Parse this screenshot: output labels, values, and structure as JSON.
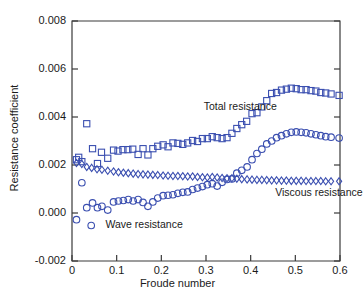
{
  "figure": {
    "background_color": "#ffffff",
    "axis_color": "#3a3a3a",
    "marker_color": "#3b4fb0",
    "text_color": "#1a1a1a"
  },
  "axes": {
    "ylabel": "Resistance coefficient",
    "xlabel": "Froude number",
    "yticks": [
      "0.008",
      "0.006",
      "0.004",
      "0.002",
      "0.000",
      "-0.002"
    ],
    "ytick_values": [
      0.008,
      0.006,
      0.004,
      0.002,
      0.0,
      -0.002
    ],
    "xticks": [
      "0",
      "0.1",
      "0.2",
      "0.3",
      "0.4",
      "0.5",
      "0.6"
    ],
    "xtick_values": [
      0,
      0.1,
      0.2,
      0.3,
      0.4,
      0.5,
      0.6
    ]
  },
  "annotations": [
    {
      "name": "total-resistance-label",
      "text": "Total resistance",
      "x": 0.295,
      "y": 0.00442
    },
    {
      "name": "viscous-resistance-label",
      "text": "Viscous resistance",
      "x": 0.455,
      "y": 0.00082
    },
    {
      "name": "wave-resistance-label",
      "text": "Wave resistance",
      "x": 0.075,
      "y": -0.00052
    }
  ],
  "legend_markers": [
    {
      "name": "wave-resistance-legend-marker",
      "marker": "circle",
      "x": 0.043,
      "y": -0.00052
    }
  ],
  "chart_data": {
    "type": "scatter",
    "title": "",
    "xlabel": "Froude number",
    "ylabel": "Resistance coefficient",
    "xlim": [
      0.0,
      0.6
    ],
    "ylim": [
      -0.002,
      0.008
    ],
    "grid": false,
    "legend_position": "inline-annotations",
    "series": [
      {
        "name": "Total resistance",
        "marker": "square",
        "color": "#3b4fb0",
        "x": [
          0.01,
          0.015,
          0.022,
          0.033,
          0.046,
          0.057,
          0.066,
          0.08,
          0.093,
          0.103,
          0.114,
          0.125,
          0.136,
          0.148,
          0.159,
          0.17,
          0.181,
          0.192,
          0.204,
          0.215,
          0.226,
          0.237,
          0.248,
          0.259,
          0.27,
          0.281,
          0.292,
          0.303,
          0.314,
          0.325,
          0.336,
          0.347,
          0.358,
          0.369,
          0.38,
          0.391,
          0.403,
          0.414,
          0.425,
          0.436,
          0.447,
          0.458,
          0.469,
          0.48,
          0.491,
          0.502,
          0.513,
          0.524,
          0.535,
          0.546,
          0.557,
          0.568,
          0.58,
          0.598
        ],
        "y": [
          0.00222,
          0.00232,
          0.00214,
          0.00372,
          0.00268,
          0.00206,
          0.00253,
          0.00228,
          0.00262,
          0.00258,
          0.00264,
          0.00264,
          0.00266,
          0.00244,
          0.00268,
          0.00242,
          0.00268,
          0.00278,
          0.00284,
          0.00276,
          0.00292,
          0.0029,
          0.00286,
          0.00292,
          0.00302,
          0.00298,
          0.0031,
          0.0031,
          0.00318,
          0.00314,
          0.0031,
          0.00314,
          0.00332,
          0.00352,
          0.00368,
          0.00382,
          0.00414,
          0.00418,
          0.00442,
          0.00468,
          0.00498,
          0.00502,
          0.00512,
          0.00516,
          0.0052,
          0.00518,
          0.00514,
          0.00514,
          0.0051,
          0.00508,
          0.00502,
          0.005,
          0.00496,
          0.0049
        ]
      },
      {
        "name": "Viscous resistance",
        "marker": "diamond",
        "color": "#3b4fb0",
        "x": [
          0.01,
          0.022,
          0.033,
          0.044,
          0.056,
          0.067,
          0.08,
          0.093,
          0.104,
          0.115,
          0.126,
          0.137,
          0.148,
          0.159,
          0.17,
          0.181,
          0.192,
          0.204,
          0.215,
          0.226,
          0.237,
          0.248,
          0.259,
          0.27,
          0.281,
          0.292,
          0.303,
          0.314,
          0.325,
          0.336,
          0.347,
          0.358,
          0.369,
          0.38,
          0.392,
          0.403,
          0.414,
          0.425,
          0.436,
          0.447,
          0.458,
          0.469,
          0.48,
          0.491,
          0.502,
          0.513,
          0.524,
          0.535,
          0.546,
          0.557,
          0.568,
          0.58,
          0.598
        ],
        "y": [
          0.00208,
          0.00204,
          0.00192,
          0.00188,
          0.00182,
          0.0018,
          0.00176,
          0.00173,
          0.0017,
          0.00168,
          0.00166,
          0.00164,
          0.00162,
          0.00161,
          0.0016,
          0.00159,
          0.00158,
          0.00156,
          0.00155,
          0.00154,
          0.00154,
          0.00153,
          0.00152,
          0.00152,
          0.0015,
          0.00149,
          0.00148,
          0.0015,
          0.00148,
          0.00146,
          0.00145,
          0.00145,
          0.00143,
          0.00141,
          0.0014,
          0.00139,
          0.00138,
          0.00138,
          0.00137,
          0.00136,
          0.00136,
          0.00135,
          0.00135,
          0.00134,
          0.00134,
          0.00134,
          0.00133,
          0.00133,
          0.00133,
          0.00133,
          0.00132,
          0.00132,
          0.00132
        ]
      },
      {
        "name": "Wave resistance",
        "marker": "circle",
        "color": "#3b4fb0",
        "x": [
          0.01,
          0.022,
          0.033,
          0.046,
          0.057,
          0.067,
          0.08,
          0.093,
          0.104,
          0.115,
          0.126,
          0.137,
          0.148,
          0.159,
          0.17,
          0.181,
          0.192,
          0.204,
          0.215,
          0.226,
          0.237,
          0.248,
          0.259,
          0.27,
          0.281,
          0.292,
          0.303,
          0.314,
          0.325,
          0.336,
          0.347,
          0.358,
          0.369,
          0.38,
          0.392,
          0.403,
          0.414,
          0.425,
          0.436,
          0.447,
          0.458,
          0.469,
          0.48,
          0.491,
          0.502,
          0.513,
          0.524,
          0.535,
          0.546,
          0.557,
          0.568,
          0.58,
          0.598
        ],
        "y": [
          -0.00028,
          0.00126,
          0.00022,
          0.00042,
          0.00022,
          0.00028,
          0.00012,
          0.00046,
          0.0005,
          0.00052,
          0.00056,
          0.0005,
          0.00056,
          0.00044,
          0.00028,
          0.00046,
          0.00062,
          0.00072,
          0.00074,
          0.00076,
          0.00082,
          0.00086,
          0.00088,
          0.00098,
          0.00104,
          0.0011,
          0.00118,
          0.00122,
          0.00112,
          0.00128,
          0.0014,
          0.00142,
          0.00166,
          0.00178,
          0.00192,
          0.00222,
          0.00248,
          0.00266,
          0.00288,
          0.003,
          0.00314,
          0.00322,
          0.0033,
          0.00336,
          0.00338,
          0.00336,
          0.00334,
          0.0033,
          0.00326,
          0.00322,
          0.00318,
          0.00316,
          0.00312
        ]
      }
    ]
  }
}
